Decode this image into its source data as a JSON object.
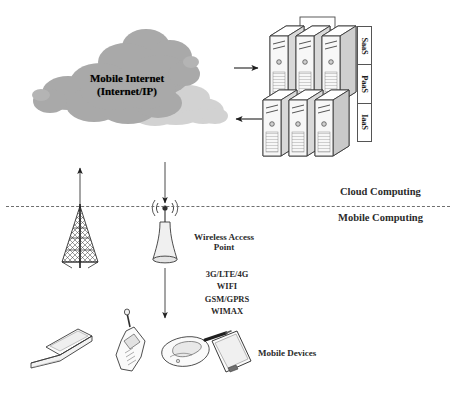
{
  "diagram": {
    "cloud": {
      "line1": "Mobile Internet",
      "line2": "(Internet/IP)",
      "fill_dark": "#a9a9a9",
      "fill_light": "#d2d2d2"
    },
    "service_models": [
      {
        "label": "SaaS"
      },
      {
        "label": "PaaS"
      },
      {
        "label": "IaaS"
      }
    ],
    "tiers": {
      "upper": "Cloud Computing",
      "lower": "Mobile Computing"
    },
    "access_point": {
      "label_line1": "Wireless Access",
      "label_line2": "Point"
    },
    "technologies": [
      "3G/LTE/4G",
      "WIFI",
      "GSM/GPRS",
      "WIMAX"
    ],
    "devices": {
      "label": "Mobile Devices",
      "items": [
        {
          "name": "laptop"
        },
        {
          "name": "mobile-phone"
        },
        {
          "name": "flip-phone"
        },
        {
          "name": "tablet-pda"
        }
      ]
    },
    "servers": {
      "count": 6,
      "rows": 2,
      "columns": 3
    },
    "colors": {
      "stroke": "#3a3a3a",
      "server_fill": "#f2f2f2",
      "server_side": "#d9d9d9",
      "arrow": "#1f1f1f",
      "divider": "#6f6f6f"
    }
  }
}
